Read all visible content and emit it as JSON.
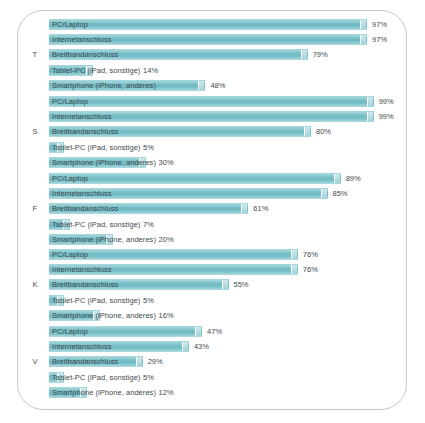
{
  "chart_data": {
    "type": "bar",
    "title": "",
    "subtitle": "",
    "xlabel": "",
    "ylabel": "",
    "xlim": [
      0,
      100
    ],
    "grid": false,
    "legend_position": "none",
    "orientation": "horizontal",
    "value_suffix": "%",
    "categories": [
      "PC/Laptop",
      "Internetanschluss",
      "Breitbandanschluss",
      "Tablet-PC (iPad, sonstige)",
      "Smartphone (iPhone, anderes)"
    ],
    "groups": [
      {
        "label": "T",
        "values": [
          97,
          97,
          79,
          14,
          48
        ],
        "value_labels": [
          "97%",
          "97%",
          "79%",
          "14%",
          "48%"
        ]
      },
      {
        "label": "S",
        "values": [
          99,
          99,
          80,
          5,
          30
        ],
        "value_labels": [
          "99%",
          "99%",
          "80%",
          "5%",
          "30%"
        ]
      },
      {
        "label": "F",
        "values": [
          89,
          85,
          61,
          7,
          20
        ],
        "value_labels": [
          "89%",
          "85%",
          "61%",
          "7%",
          "20%"
        ]
      },
      {
        "label": "K",
        "values": [
          76,
          76,
          55,
          5,
          16
        ],
        "value_labels": [
          "76%",
          "76%",
          "55%",
          "5%",
          "16%"
        ]
      },
      {
        "label": "V",
        "values": [
          47,
          43,
          29,
          5,
          12
        ],
        "value_labels": [
          "47%",
          "43%",
          "29%",
          "5%",
          "12%"
        ]
      }
    ],
    "colors": {
      "bar_light": "#a9d8dd",
      "bar_mid": "#78bfc8",
      "bar_dark": "#6fbac4",
      "bar_cap": "#cfe8eb",
      "text": "#3e4a4d",
      "frame_border": "#c8c8c8",
      "background": "#ffffff"
    }
  }
}
